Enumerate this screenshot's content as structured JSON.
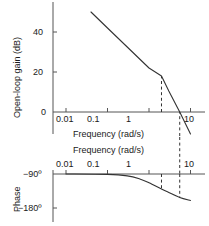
{
  "figure": {
    "type": "bode-plot",
    "line_color": "#333333",
    "axis_color": "#555555",
    "dash_color": "#333333",
    "background": "#ffffff"
  },
  "magnitude": {
    "ylabel": "Open-loop gain (dB)",
    "xlabel": "Frequency (rad/s)",
    "yticks": [
      "40",
      "20",
      "0"
    ],
    "xticks": [
      "0.01",
      "0.1",
      "1",
      "10"
    ]
  },
  "phase": {
    "ylabel": "Phase",
    "xlabel": "Frequency (rad/s)",
    "yticks": [
      "−90º",
      "−180º"
    ],
    "xticks": [
      "0.01",
      "0.1",
      "1",
      "10"
    ]
  },
  "chart_data": [
    {
      "type": "line",
      "name": "magnitude",
      "title": "",
      "xlabel": "Frequency (rad/s)",
      "ylabel": "Open-loop gain (dB)",
      "xscale": "log",
      "xlim": [
        0.005,
        13
      ],
      "ylim": [
        -12,
        52
      ],
      "xticks": [
        0.01,
        0.1,
        1,
        10
      ],
      "xticklabels": [
        "0.01",
        "0.1",
        "1",
        "10"
      ],
      "yticks": [
        0,
        20,
        40
      ],
      "yticklabels": [
        "0",
        "20",
        "40"
      ],
      "grid": false,
      "legend": false,
      "series": [
        {
          "name": "open-loop gain",
          "x": [
            0.04,
            0.1,
            1.0,
            2.0,
            3.0,
            5.5,
            10.0
          ],
          "y": [
            50.0,
            42.0,
            22.0,
            18.0,
            10.5,
            0.0,
            -11.0
          ]
        }
      ],
      "annotations": [
        {
          "kind": "vertical-dashed",
          "x": 2.0,
          "y_from": 0,
          "y_to": 18,
          "note": "corner frequency"
        },
        {
          "kind": "vertical-dashed",
          "x": 5.5,
          "y_from": -12,
          "y_to": 0,
          "note": "gain crossover frequency"
        }
      ]
    },
    {
      "type": "line",
      "name": "phase",
      "title": "",
      "xlabel": "Frequency (rad/s)",
      "ylabel": "Phase",
      "xscale": "log",
      "xlim": [
        0.005,
        13
      ],
      "ylim": [
        -190,
        -85
      ],
      "xticks": [
        0.01,
        0.1,
        1,
        10
      ],
      "xticklabels": [
        "0.01",
        "0.1",
        "1",
        "10"
      ],
      "yticks": [
        -90,
        -180
      ],
      "yticklabels": [
        "−90º",
        "−180º"
      ],
      "grid": false,
      "legend": false,
      "series": [
        {
          "name": "open-loop phase",
          "x": [
            0.01,
            0.1,
            0.3,
            0.6,
            1.0,
            2.0,
            3.0,
            5.5,
            10.0
          ],
          "y": [
            -90.0,
            -91.0,
            -95.0,
            -103.0,
            -113.0,
            -130.0,
            -139.0,
            -152.0,
            -160.0
          ]
        }
      ],
      "annotations": [
        {
          "kind": "vertical-dashed",
          "x": 2.0,
          "y_from": -90,
          "y_to": -132,
          "note": "corner frequency"
        },
        {
          "kind": "vertical-dashed",
          "x": 5.5,
          "y_from": -90,
          "y_to": -153,
          "note": "gain crossover frequency / phase margin"
        }
      ]
    }
  ]
}
